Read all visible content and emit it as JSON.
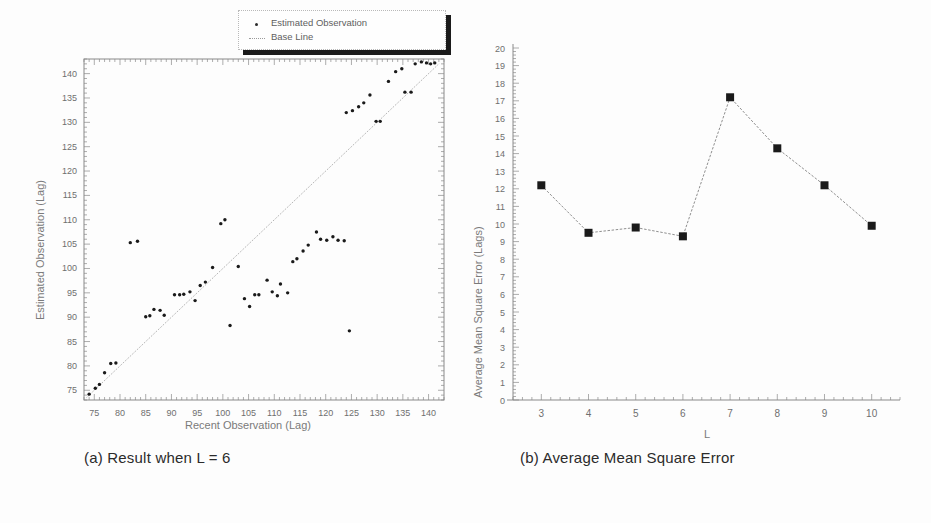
{
  "figure": {
    "panel_a": {
      "caption": "(a) Result when L = 6",
      "legend": {
        "items": [
          {
            "label": "Estimated Observation",
            "marker": "dot"
          },
          {
            "label": "Base Line",
            "marker": "line"
          }
        ]
      }
    },
    "panel_b": {
      "caption": "(b) Average Mean Square Error"
    },
    "footer_faint": ""
  },
  "colors": {
    "axis": "#8a8a8a",
    "marker": "#1a1a1a",
    "baseline": "#9c9c9c",
    "line": "#8f8f8f",
    "tick_text": "#6f6f6f",
    "caption_text": "#2b2b2b",
    "legend_shadow": "#1b1b1b"
  },
  "chart_data": [
    {
      "type": "scatter",
      "title": "(a) Result when L = 6",
      "xlabel": "Recent Observation (Lag)",
      "ylabel": "Estimated Observation (Lag)",
      "xlim": [
        73,
        143
      ],
      "ylim": [
        73,
        143
      ],
      "xticks": [
        75,
        80,
        85,
        90,
        95,
        100,
        105,
        110,
        115,
        120,
        125,
        130,
        135,
        140
      ],
      "yticks": [
        75,
        80,
        85,
        90,
        95,
        100,
        105,
        110,
        115,
        120,
        125,
        130,
        135,
        140
      ],
      "minor_tick_interval": 1,
      "grid": false,
      "legend": [
        "Estimated Observation",
        "Base Line"
      ],
      "legend_position": "top-right-outside",
      "series": [
        {
          "name": "Estimated Observation",
          "marker": "dot",
          "points": [
            [
              74.0,
              74.2
            ],
            [
              75.2,
              75.4
            ],
            [
              76.0,
              76.2
            ],
            [
              77.0,
              78.6
            ],
            [
              78.2,
              80.5
            ],
            [
              79.2,
              80.6
            ],
            [
              82.0,
              105.3
            ],
            [
              83.4,
              105.6
            ],
            [
              85.0,
              90.1
            ],
            [
              85.8,
              90.3
            ],
            [
              86.6,
              91.6
            ],
            [
              87.8,
              91.4
            ],
            [
              88.6,
              90.4
            ],
            [
              90.6,
              94.6
            ],
            [
              91.6,
              94.6
            ],
            [
              92.4,
              94.7
            ],
            [
              93.6,
              95.2
            ],
            [
              94.6,
              93.4
            ],
            [
              95.6,
              96.5
            ],
            [
              96.6,
              97.2
            ],
            [
              98.0,
              100.2
            ],
            [
              99.6,
              109.2
            ],
            [
              100.4,
              110.0
            ],
            [
              101.4,
              88.3
            ],
            [
              103.0,
              100.4
            ],
            [
              104.2,
              93.8
            ],
            [
              105.2,
              92.2
            ],
            [
              106.2,
              94.6
            ],
            [
              107.0,
              94.6
            ],
            [
              108.6,
              97.6
            ],
            [
              109.6,
              95.2
            ],
            [
              110.6,
              94.4
            ],
            [
              111.2,
              96.8
            ],
            [
              112.6,
              95.0
            ],
            [
              113.6,
              101.4
            ],
            [
              114.4,
              102.0
            ],
            [
              115.6,
              103.6
            ],
            [
              116.6,
              104.8
            ],
            [
              118.2,
              107.5
            ],
            [
              119.0,
              106.0
            ],
            [
              120.2,
              105.8
            ],
            [
              121.4,
              106.5
            ],
            [
              122.4,
              105.8
            ],
            [
              123.6,
              105.7
            ],
            [
              124.6,
              87.2
            ],
            [
              124.0,
              132.0
            ],
            [
              125.2,
              132.4
            ],
            [
              126.4,
              133.2
            ],
            [
              127.4,
              134.0
            ],
            [
              128.6,
              135.6
            ],
            [
              129.8,
              130.2
            ],
            [
              130.6,
              130.2
            ],
            [
              132.2,
              138.4
            ],
            [
              133.6,
              140.4
            ],
            [
              134.8,
              141.0
            ],
            [
              135.4,
              136.2
            ],
            [
              136.6,
              136.2
            ],
            [
              137.4,
              142.0
            ],
            [
              138.6,
              142.4
            ],
            [
              139.6,
              142.2
            ],
            [
              140.4,
              142.0
            ],
            [
              141.2,
              142.2
            ]
          ]
        },
        {
          "name": "Base Line",
          "marker": "line",
          "points": [
            [
              73.5,
              73.5
            ],
            [
              142.0,
              142.0
            ]
          ]
        }
      ]
    },
    {
      "type": "line",
      "title": "(b) Average Mean Square Error",
      "xlabel": "L",
      "ylabel": "Average Mean Square Error (Lags)",
      "xlim": [
        2.4,
        10.6
      ],
      "ylim": [
        0,
        20
      ],
      "xticks": [
        3,
        4,
        5,
        6,
        7,
        8,
        9,
        10
      ],
      "yticks": [
        0,
        1,
        2,
        3,
        4,
        5,
        6,
        7,
        8,
        9,
        10,
        11,
        12,
        13,
        14,
        15,
        16,
        17,
        18,
        19,
        20
      ],
      "minor_tick_interval": 0.2,
      "grid": false,
      "categories": [
        3,
        4,
        5,
        6,
        7,
        8,
        9,
        10
      ],
      "values": [
        12.2,
        9.5,
        9.8,
        9.3,
        17.2,
        14.3,
        12.2,
        9.9
      ],
      "marker": "square",
      "series": [
        {
          "name": "Average Mean Square Error",
          "values": [
            12.2,
            9.5,
            9.8,
            9.3,
            17.2,
            14.3,
            12.2,
            9.9
          ]
        }
      ]
    }
  ]
}
